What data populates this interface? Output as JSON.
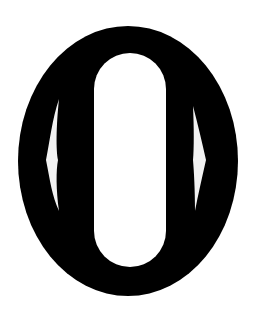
{
  "glyph": {
    "character": "0",
    "description": "Stylized bold zero glyph with oval outer shape, pill-shaped inner counter, and two thin side slits",
    "colors": {
      "background": "#ffffff",
      "fill": "#000000",
      "counter": "#ffffff",
      "slits": "#f2f2f2"
    }
  }
}
